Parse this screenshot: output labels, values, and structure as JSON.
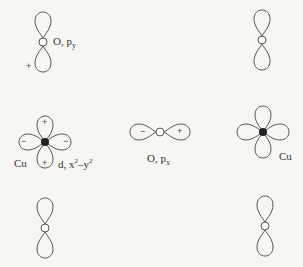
{
  "diagram": {
    "type": "orbital-overlap",
    "orbitals": [
      {
        "id": "o-py-top-left",
        "atom": "O",
        "orbital": "py",
        "label": "O, p",
        "subscript": "y",
        "sign_bottom": "+"
      },
      {
        "id": "cu-left",
        "atom": "Cu",
        "orbital": "d, x²–y²",
        "label_atom": "Cu",
        "label_orbital": "d, x",
        "signs": {
          "top": "+",
          "bottom": "+",
          "left": "−",
          "right": "−"
        }
      },
      {
        "id": "o-px-middle",
        "atom": "O",
        "label": "O, p",
        "subscript": "x",
        "signs": {
          "left": "−",
          "right": "+"
        }
      },
      {
        "id": "cu-right",
        "atom": "Cu",
        "label_atom": "Cu"
      },
      {
        "id": "o-py-top-right",
        "atom": "O",
        "orbital": "py"
      },
      {
        "id": "o-py-bottom-left",
        "atom": "O",
        "orbital": "py"
      },
      {
        "id": "o-py-bottom-right",
        "atom": "O",
        "orbital": "py"
      }
    ],
    "labels": {
      "o_py": "O, p",
      "o_py_sub": "y",
      "cu": "Cu",
      "cu_d": "d, x",
      "cu_d_sup1": "2",
      "cu_d_mid": "–y",
      "cu_d_sup2": "2",
      "o_px": "O, p",
      "o_px_sub": "x",
      "cu_right": "Cu",
      "plus": "+",
      "minus": "−"
    }
  }
}
